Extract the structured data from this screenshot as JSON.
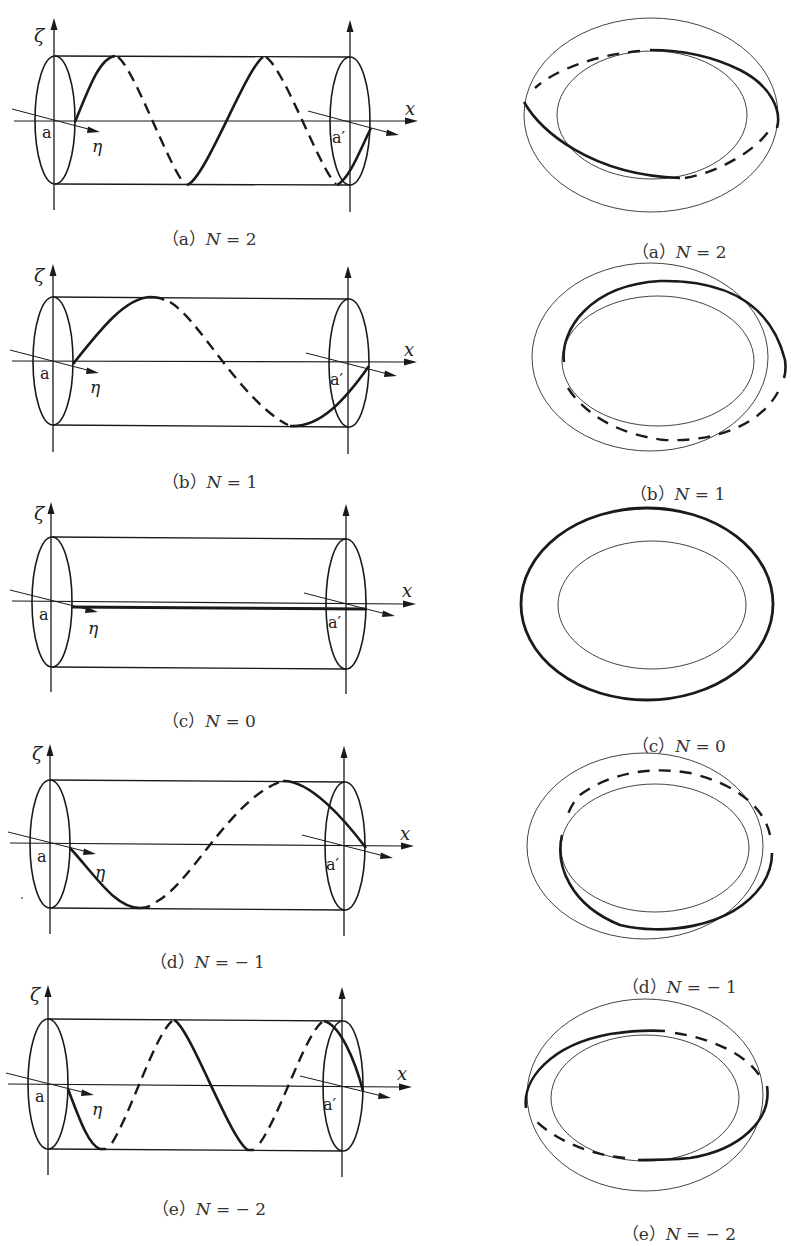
{
  "figure": {
    "axis_labels": {
      "zeta": "ζ",
      "eta": "η",
      "x": "x",
      "a": "a",
      "a_prime": "a′"
    },
    "colors": {
      "line": "#1a1a1a",
      "thin": "#444444",
      "caption": "#333333",
      "background": "#ffffff"
    },
    "rows": [
      {
        "id": "a",
        "N": "2",
        "cyl_caption": "（a）N = 2",
        "ring_caption": "（a）N = 2",
        "cyl_caption_parts": {
          "open": "（a）",
          "var": "N",
          "rest": " = 2"
        }
      },
      {
        "id": "b",
        "N": "1",
        "cyl_caption": "（b）N = 1",
        "ring_caption": "（b）N = 1",
        "cyl_caption_parts": {
          "open": "（b）",
          "var": "N",
          "rest": " = 1"
        }
      },
      {
        "id": "c",
        "N": "0",
        "cyl_caption": "（c）N = 0",
        "ring_caption": "（c）N = 0",
        "cyl_caption_parts": {
          "open": "（c）",
          "var": "N",
          "rest": " = 0"
        }
      },
      {
        "id": "d",
        "N": "−1",
        "cyl_caption": "（d）N = − 1",
        "ring_caption": "（d）N = − 1",
        "cyl_caption_parts": {
          "open": "（d）",
          "var": "N",
          "rest": " = − 1"
        }
      },
      {
        "id": "e",
        "N": "−2",
        "cyl_caption": "（e）N = − 2",
        "ring_caption": "（e）N = − 2",
        "cyl_caption_parts": {
          "open": "（e）",
          "var": "N",
          "rest": " = − 2"
        }
      }
    ]
  }
}
